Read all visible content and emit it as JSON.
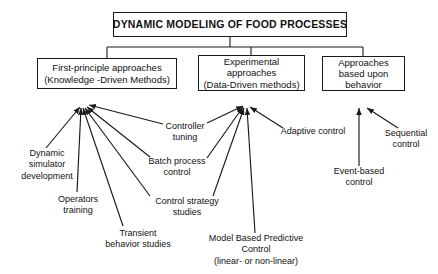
{
  "diagram": {
    "title": "DYNAMIC MODELING OF FOOD PROCESSES",
    "root": {
      "label": "DYNAMIC MODELING OF FOOD PROCESSES"
    },
    "branches": [
      {
        "id": "first-principle",
        "line1": "First-principle approaches",
        "line2": "(Knowledge -Driven Methods)",
        "leaves": [
          {
            "id": "dynamic-simulator-development",
            "line1": "Dynamic",
            "line2": "simulator",
            "line3": "development"
          },
          {
            "id": "operators-training",
            "line1": "Operators",
            "line2": "training"
          },
          {
            "id": "transient-behavior-studies",
            "line1": "Transient",
            "line2": "behavior  studies"
          },
          {
            "id": "control-strategy-studies",
            "line1": "Control strategy",
            "line2": "studies"
          },
          {
            "id": "batch-process-control",
            "line1": "Batch process",
            "line2": "control"
          },
          {
            "id": "controller-tuning",
            "line1": "Controller",
            "line2": "tuning"
          }
        ]
      },
      {
        "id": "experimental",
        "line1": "Experimental",
        "line2": "approaches",
        "line3": "(Data-Driven methods)",
        "leaves": [
          {
            "id": "controller-tuning-shared",
            "line1": "Controller",
            "line2": "tuning"
          },
          {
            "id": "batch-process-control-shared",
            "line1": "Batch process",
            "line2": "control"
          },
          {
            "id": "control-strategy-studies-shared",
            "line1": "Control strategy",
            "line2": "studies"
          },
          {
            "id": "model-based-predictive-control",
            "line1": "Model Based Predictive",
            "line2": "Control",
            "line3": "(linear- or non-linear)"
          },
          {
            "id": "adaptive-control",
            "line1": "Adaptive control"
          }
        ]
      },
      {
        "id": "behavior",
        "line1": "Approaches",
        "line2": "based upon",
        "line3": "behavior",
        "leaves": [
          {
            "id": "event-based-control",
            "line1": "Event-based",
            "line2": "control"
          },
          {
            "id": "sequential-control",
            "line1": "Sequential",
            "line2": "control"
          }
        ]
      }
    ],
    "leaf_labels": {
      "dynamic_simulator_development": {
        "l1": "Dynamic",
        "l2": "simulator",
        "l3": "development"
      },
      "operators_training": {
        "l1": "Operators",
        "l2": "training"
      },
      "transient_behavior_studies": {
        "l1": "Transient",
        "l2": "behavior  studies"
      },
      "controller_tuning": {
        "l1": "Controller",
        "l2": "tuning"
      },
      "batch_process_control": {
        "l1": "Batch process",
        "l2": "control"
      },
      "control_strategy_studies": {
        "l1": "Control strategy",
        "l2": "studies"
      },
      "model_based_predictive_control": {
        "l1": "Model Based Predictive",
        "l2": "Control",
        "l3": "(linear- or non-linear)"
      },
      "adaptive_control": {
        "l1": "Adaptive control"
      },
      "event_based_control": {
        "l1": "Event-based",
        "l2": "control"
      },
      "sequential_control": {
        "l1": "Sequential",
        "l2": "control"
      }
    },
    "colors": {
      "stroke": "#1a1a1a",
      "text": "#111111",
      "background": "#ffffff"
    }
  }
}
